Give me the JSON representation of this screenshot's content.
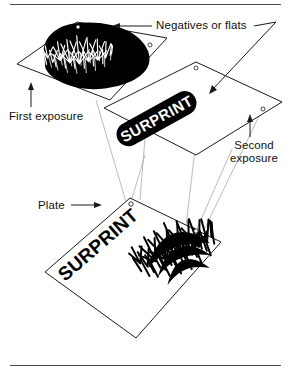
{
  "figure": {
    "background_color": "#ffffff",
    "ink_color": "#000000",
    "rule_color": "#4a4a4a",
    "projection_line_color": "#9a9a9a"
  },
  "labels": {
    "negatives": "Negatives or flats",
    "first_exposure": "First exposure",
    "second_exposure_line1": "Second",
    "second_exposure_line2": "exposure",
    "plate": "Plate"
  },
  "artwork": {
    "negative_one": {
      "name": "first-negative",
      "content": "grass-image",
      "content_description": "Solid black irregular blob with white grass and fern strokes reversed out",
      "registration_holes": 2
    },
    "negative_two": {
      "name": "second-negative",
      "content_text": "SURPRINT",
      "content_description": "Black rounded pill panel with SURPRINT reversed out in white",
      "registration_holes": 2
    },
    "plate": {
      "name": "printing-plate",
      "content_text": "SURPRINT",
      "content_description": "Black grass image with SURPRINT overprinted in black type",
      "registration_holes": 2
    }
  }
}
